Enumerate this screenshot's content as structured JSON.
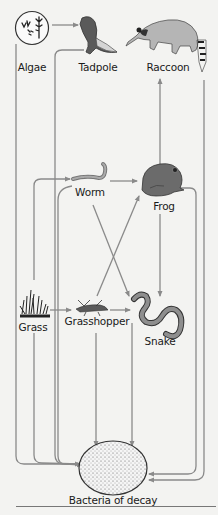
{
  "organisms": {
    "algae": {
      "label": "Algae",
      "x": 32,
      "y": 61
    },
    "tadpole": {
      "label": "Tadpole",
      "x": 98,
      "y": 61
    },
    "raccoon": {
      "label": "Raccoon",
      "x": 168,
      "y": 61
    },
    "worm": {
      "label": "Worm",
      "x": 90,
      "y": 186
    },
    "frog": {
      "label": "Frog",
      "x": 164,
      "y": 200
    },
    "grass": {
      "label": "Grass",
      "x": 33,
      "y": 321
    },
    "grasshopper": {
      "label": "Grasshopper",
      "x": 97,
      "y": 315
    },
    "snake": {
      "label": "Snake",
      "x": 160,
      "y": 335
    },
    "bacteria": {
      "label": "Bacteria of decay",
      "x": 113,
      "y": 494
    }
  },
  "relationships": [
    {
      "from": "Algae",
      "to": "Tadpole"
    },
    {
      "from": "Algae",
      "to": "Bacteria of decay"
    },
    {
      "from": "Tadpole",
      "to": "Bacteria of decay"
    },
    {
      "from": "Grass",
      "to": "Worm"
    },
    {
      "from": "Grass",
      "to": "Grasshopper"
    },
    {
      "from": "Grass",
      "to": "Bacteria of decay"
    },
    {
      "from": "Worm",
      "to": "Frog"
    },
    {
      "from": "Worm",
      "to": "Snake"
    },
    {
      "from": "Grasshopper",
      "to": "Frog"
    },
    {
      "from": "Grasshopper",
      "to": "Snake"
    },
    {
      "from": "Grasshopper",
      "to": "Bacteria of decay"
    },
    {
      "from": "Frog",
      "to": "Raccoon"
    },
    {
      "from": "Frog",
      "to": "Snake"
    },
    {
      "from": "Frog",
      "to": "Bacteria of decay"
    },
    {
      "from": "Snake",
      "to": "Bacteria of decay"
    },
    {
      "from": "Raccoon",
      "to": "Bacteria of decay"
    }
  ],
  "colors": {
    "arrow": "#8a8a8a",
    "background": "#f3f3f1",
    "frog": "#6b6b6b",
    "raccoon": "#b5b5b5",
    "outline": "#333333"
  }
}
